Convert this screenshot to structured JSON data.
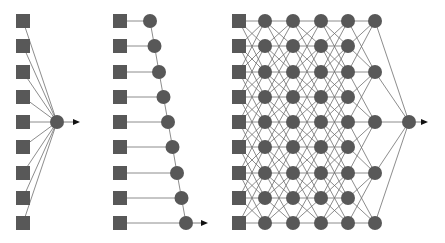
{
  "diagram": {
    "title": "",
    "colors": {
      "node": "#585858",
      "edge": "#6e6e6e",
      "arrow_head": "#111111",
      "background": "#ffffff"
    },
    "row_y": [
      21,
      46,
      72,
      97,
      122,
      147,
      173,
      198,
      223
    ],
    "node_radius": 7,
    "square_size": 14,
    "networks": [
      {
        "name": "single-layer-perceptron",
        "input_x": 23,
        "inputs": 9,
        "output": {
          "x": 57,
          "y": 122
        },
        "arrow_end_x": 80,
        "connectivity": "all-inputs-to-output"
      },
      {
        "name": "chain-network",
        "input_x": 120,
        "inputs": 9,
        "chain_x": [
          150,
          154.5,
          159,
          163.5,
          168,
          172.5,
          177,
          181.5,
          186
        ],
        "arrow_end_x": 208,
        "connectivity": "each-input-to-own-node-then-chain"
      },
      {
        "name": "deep-network",
        "input_x": 239,
        "inputs": 9,
        "hidden_columns": [
          {
            "x": 265,
            "rows": [
              0,
              1,
              2,
              3,
              4,
              5,
              6,
              7,
              8
            ]
          },
          {
            "x": 293,
            "rows": [
              0,
              1,
              2,
              3,
              4,
              5,
              6,
              7,
              8
            ]
          },
          {
            "x": 321,
            "rows": [
              0,
              1,
              2,
              3,
              4,
              5,
              6,
              7,
              8
            ]
          },
          {
            "x": 348,
            "rows": [
              0,
              1,
              2,
              3,
              4,
              5,
              6,
              7,
              8
            ]
          },
          {
            "x": 375,
            "rows": [
              0,
              2,
              4,
              6,
              8
            ]
          }
        ],
        "neighbor_span": 2,
        "output": {
          "x": 409,
          "y": 122
        },
        "arrow_end_x": 428,
        "connectivity": "local-neighbor-plus-minus-2"
      }
    ]
  }
}
